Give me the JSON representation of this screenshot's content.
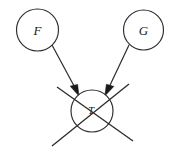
{
  "diagram": {
    "kind": "causal-graph",
    "title": "",
    "background_color": "#ffffff",
    "stroke_color": "#2b2b2b",
    "label_color": "#1a1a1a",
    "nodes": [
      {
        "id": "F",
        "label": "F",
        "cx": 37.5,
        "cy": 30.0,
        "r": 21.0,
        "struck_out": false
      },
      {
        "id": "G",
        "label": "G",
        "cx": 143.5,
        "cy": 30.0,
        "r": 20.0,
        "struck_out": false
      },
      {
        "id": "T",
        "label": "T",
        "cx": 92.0,
        "cy": 111.0,
        "r": 21.0,
        "struck_out": true
      }
    ],
    "edges": [
      {
        "id": "F-to-T",
        "from": "F",
        "to": "T",
        "arrow": "to",
        "x1": 52.0,
        "y1": 45.0,
        "x2": 79.0,
        "y2": 95.0
      },
      {
        "id": "G-to-T",
        "from": "G",
        "to": "T",
        "arrow": "to",
        "x1": 129.0,
        "y1": 45.0,
        "x2": 105.0,
        "y2": 95.0
      }
    ],
    "strike_lines": [
      {
        "id": "strike-nwse",
        "x1": 57.0,
        "y1": 87.0,
        "x2": 133.0,
        "y2": 141.0
      },
      {
        "id": "strike-nesw",
        "x1": 129.0,
        "y1": 84.0,
        "x2": 52.0,
        "y2": 146.0
      }
    ]
  }
}
